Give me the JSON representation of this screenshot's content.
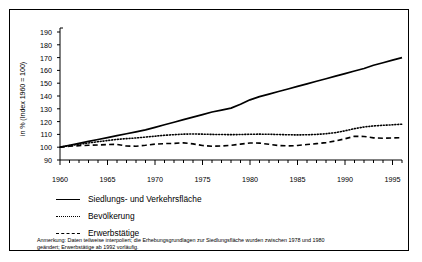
{
  "chart_data": {
    "type": "line",
    "title": "",
    "xlabel": "",
    "ylabel": "in % (Index 1960 = 100)",
    "xlim": [
      1960,
      1996
    ],
    "ylim": [
      90,
      190
    ],
    "ytick_labels": [
      "190",
      "180",
      "170",
      "160",
      "150",
      "140",
      "130",
      "120",
      "110",
      "100",
      "90"
    ],
    "yticks": [
      190,
      180,
      170,
      160,
      150,
      140,
      130,
      120,
      110,
      100,
      90
    ],
    "xtick_labels": [
      "1960",
      "1965",
      "1970",
      "1975",
      "1980",
      "1985",
      "1990",
      "1995"
    ],
    "xticks": [
      1960,
      1965,
      1970,
      1975,
      1980,
      1985,
      1990,
      1995
    ],
    "grid": false,
    "legend_position": "below-axis",
    "x": [
      1960,
      1961,
      1962,
      1963,
      1964,
      1965,
      1966,
      1967,
      1968,
      1969,
      1970,
      1971,
      1972,
      1973,
      1974,
      1975,
      1976,
      1977,
      1978,
      1979,
      1980,
      1981,
      1982,
      1983,
      1984,
      1985,
      1986,
      1987,
      1988,
      1989,
      1990,
      1991,
      1992,
      1993,
      1994,
      1995,
      1996
    ],
    "series": [
      {
        "name": "Siedlungs- und Verkehrsfläche",
        "style": "solid",
        "color": "#000000",
        "values": [
          100,
          101.5,
          103,
          104.5,
          106,
          107.5,
          109,
          110.5,
          112,
          113.5,
          115.5,
          117.5,
          119.5,
          121.5,
          123.5,
          125.5,
          127.5,
          129,
          130.5,
          133.5,
          137,
          139.5,
          141.5,
          143.5,
          145.5,
          147.5,
          149.5,
          151.5,
          153.5,
          155.5,
          157.5,
          159.5,
          161.5,
          164,
          166,
          168,
          170
        ]
      },
      {
        "name": "Bevölkerung",
        "style": "dotted",
        "color": "#000000",
        "values": [
          100,
          101.2,
          102.3,
          103.3,
          104.3,
          105.2,
          106.1,
          106.7,
          107.2,
          107.9,
          108.6,
          109.3,
          109.8,
          110.2,
          110.3,
          110.2,
          110,
          109.9,
          109.8,
          109.9,
          110.1,
          110.2,
          110.1,
          109.9,
          109.7,
          109.6,
          109.7,
          110,
          110.5,
          111.4,
          112.8,
          114.5,
          115.8,
          116.6,
          117.1,
          117.5,
          118
        ]
      },
      {
        "name": "Erwerbstätige",
        "style": "dashed",
        "color": "#000000",
        "values": [
          100,
          100.7,
          101.2,
          101.5,
          101.7,
          102.1,
          102.2,
          100.9,
          100.8,
          101.5,
          102.4,
          102.8,
          103,
          103.4,
          102.6,
          101.3,
          100.8,
          100.9,
          101.5,
          102.4,
          103.3,
          103.2,
          102.3,
          101.3,
          101,
          101.3,
          102.1,
          102.8,
          103.6,
          104.9,
          106.6,
          108.5,
          108.4,
          107.3,
          107,
          107.2,
          107.5
        ]
      }
    ]
  },
  "legend": {
    "items": [
      {
        "label": "Siedlungs- und Verkehrsfläche",
        "style": "solid"
      },
      {
        "label": "Bevölkerung",
        "style": "dotted"
      },
      {
        "label": "Erwerbstätige",
        "style": "dashed"
      }
    ]
  },
  "note": {
    "line1": "Anmerkung: Daten teilweise interpoliert; die Erhebungsgrundlagen zur Siedlungsfläche wurden zwischen 1978 und 1980",
    "line2": "geändert; Erwerbstätige ab 1992 vorläufig."
  }
}
